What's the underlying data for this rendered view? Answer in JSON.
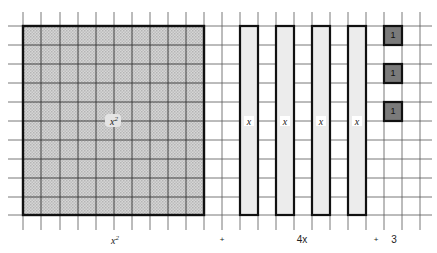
{
  "diagram": {
    "type": "algebra-tiles",
    "expression": "x² + 4x + 3",
    "grid": {
      "columns": 22,
      "rows": 10,
      "line_color": "#555555"
    },
    "tiles": {
      "x_squared": {
        "label": "x",
        "superscript": "2",
        "count": 1,
        "fill": "#c8c8c8",
        "border": "#111111"
      },
      "x": {
        "label": "x",
        "count": 4,
        "fill": "#ececec",
        "border": "#111111"
      },
      "unit": {
        "label": "1",
        "count": 3,
        "fill": "#7a7a7a",
        "border": "#111111"
      }
    },
    "captions": {
      "x_squared_base": "x",
      "x_squared_exp": "2",
      "plus_1": "+",
      "four_x": "4x",
      "plus_2": "+",
      "three": "3"
    }
  }
}
